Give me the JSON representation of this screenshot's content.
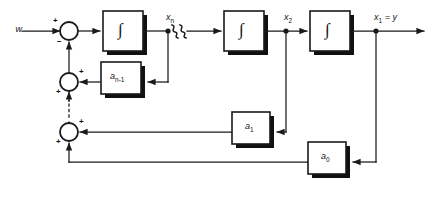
{
  "figure": {
    "type": "control-system-block-diagram",
    "background": "#ffffff",
    "line_color": "#1a1a1a",
    "shadow_color": "#111111"
  },
  "signals": {
    "input": "w",
    "state_n": "x",
    "state_n_sub": "n",
    "state_2": "x",
    "state_2_sub": "2",
    "output": "x",
    "output_sub": "1",
    "output_eq": "= y",
    "break_symbol": "≈"
  },
  "blocks": {
    "integrator_symbol": "∫",
    "integrators": [
      {
        "name": "integrator-n",
        "symbol": "∫"
      },
      {
        "name": "integrator-2",
        "symbol": "∫"
      },
      {
        "name": "integrator-1",
        "symbol": "∫"
      }
    ],
    "gains": [
      {
        "name": "gain-a-n-1",
        "base": "a",
        "sub": "n-1"
      },
      {
        "name": "gain-a-1",
        "base": "a",
        "sub": "1"
      },
      {
        "name": "gain-a-0",
        "base": "a",
        "sub": "0"
      }
    ]
  },
  "summers": [
    {
      "name": "summer-top",
      "signs": {
        "left": "+",
        "bottom": "−"
      }
    },
    {
      "name": "summer-middle",
      "signs": {
        "right": "+",
        "bottom": "+"
      }
    },
    {
      "name": "summer-bottom",
      "signs": {
        "right": "+",
        "bottom": "+"
      }
    }
  ],
  "annotations": {
    "ellipsis": "⋮",
    "note_break": "signal path break (omitted intermediate stages)"
  }
}
